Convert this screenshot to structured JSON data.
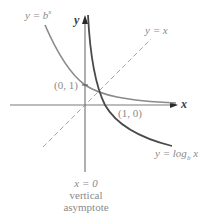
{
  "figure": {
    "axes": {
      "x_label": "x",
      "y_label": "y"
    },
    "curves": {
      "exponential": {
        "label_y": "y = ",
        "label_base": "b",
        "label_exp": "x"
      },
      "logarithm": {
        "label_prefix": "y = log",
        "label_base": "b",
        "label_arg": " x"
      },
      "identity": {
        "label": "y = x"
      }
    },
    "points": {
      "exp_intercept": "(0, 1)",
      "log_intercept": "(1, 0)"
    },
    "asymptote": {
      "equation": "x = 0",
      "line1": "vertical",
      "line2": "asymptote"
    },
    "colors": {
      "axis": "#7a7a7a",
      "exponential": "#8a8a8a",
      "logarithm": "#4a4a4a",
      "identity_dashed": "#a8a8a8",
      "text": "#8a8a8a"
    }
  }
}
